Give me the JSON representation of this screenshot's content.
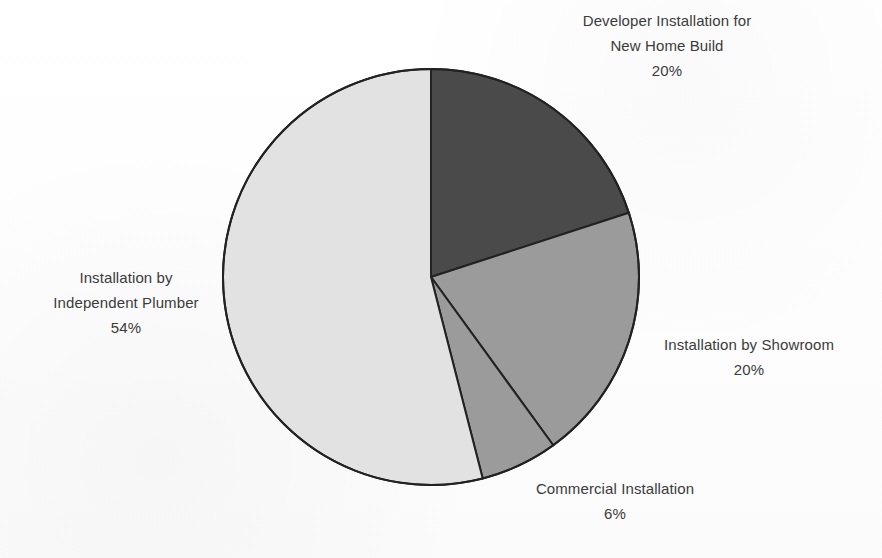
{
  "chart_data": {
    "type": "pie",
    "title": "",
    "subtitle": "",
    "xlabel": "",
    "ylabel": "",
    "legend_position": "none",
    "grid": false,
    "start_angle_deg": 0,
    "direction": "clockwise",
    "categories": [
      "Developer Installation for New Home Build",
      "Installation by Showroom",
      "Commercial Installation",
      "Installation by Independent Plumber"
    ],
    "values": [
      20,
      20,
      6,
      54
    ],
    "value_unit": "%",
    "slices": [
      {
        "key": "developer",
        "label_lines": [
          "Developer Installation for",
          "New Home Build"
        ],
        "percent_text": "20%",
        "value": 20,
        "color": "#4a4a4a",
        "start_deg": 0,
        "end_deg": 72
      },
      {
        "key": "showroom",
        "label_lines": [
          "Installation by Showroom"
        ],
        "percent_text": "20%",
        "value": 20,
        "color": "#9b9b9b",
        "start_deg": 72,
        "end_deg": 144
      },
      {
        "key": "commercial",
        "label_lines": [
          "Commercial Installation"
        ],
        "percent_text": "6%",
        "value": 6,
        "color": "#9b9b9b",
        "start_deg": 144,
        "end_deg": 165.6
      },
      {
        "key": "plumber",
        "label_lines": [
          "Installation by",
          "Independent Plumber"
        ],
        "percent_text": "54%",
        "value": 54,
        "color": "#e2e2e2",
        "start_deg": 165.6,
        "end_deg": 360
      }
    ],
    "outline_color": "#222222",
    "outline_width": 2,
    "background_color": "#fefefe",
    "label_color": "#3b3b3b",
    "geometry": {
      "cx": 431,
      "cy": 277,
      "r": 208
    }
  },
  "labels": {
    "developer": {
      "line1": "Developer Installation for",
      "line2": "New Home Build",
      "percent": "20%"
    },
    "plumber": {
      "line1": "Installation by",
      "line2": "Independent Plumber",
      "percent": "54%"
    },
    "showroom": {
      "line1": "Installation by Showroom",
      "percent": "20%"
    },
    "commercial": {
      "line1": "Commercial Installation",
      "percent": "6%"
    }
  }
}
